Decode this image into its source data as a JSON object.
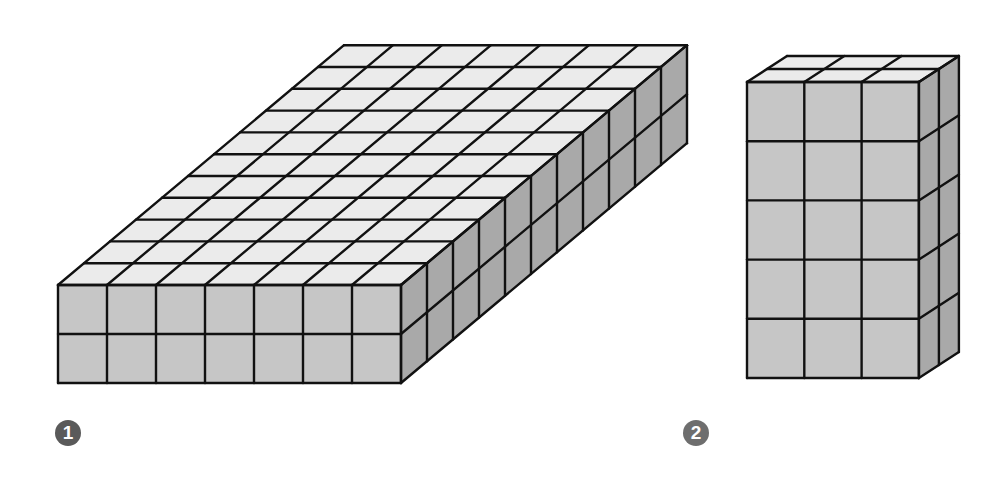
{
  "colors": {
    "background": "#ffffff",
    "top_face": "#ebebeb",
    "front_face": "#c6c6c6",
    "side_face": "#a9a9a9",
    "edge": "#111111",
    "badge_1": "#5a5a5a",
    "badge_2": "#6e6e6e"
  },
  "figures": [
    {
      "id": "1",
      "label": "1",
      "description": "Rectangular prism built from unit cubes",
      "cubes_wide": 7,
      "cubes_deep": 11,
      "cubes_high": 2,
      "geometry": {
        "front_left": 58,
        "front_top": 285,
        "cube_w": 49,
        "cube_h": 49,
        "depth_dx": 26.0,
        "depth_dy": -21.8
      },
      "badge": {
        "x": 55,
        "y": 420
      }
    },
    {
      "id": "2",
      "label": "2",
      "description": "Rectangular prism built from unit cubes",
      "cubes_wide": 3,
      "cubes_deep": 2,
      "cubes_high": 5,
      "geometry": {
        "front_left": 747,
        "front_top": 82,
        "cube_w": 57.3,
        "cube_h": 59.2,
        "depth_dx": 20.0,
        "depth_dy": -13.0
      },
      "badge": {
        "x": 683,
        "y": 420
      }
    }
  ]
}
